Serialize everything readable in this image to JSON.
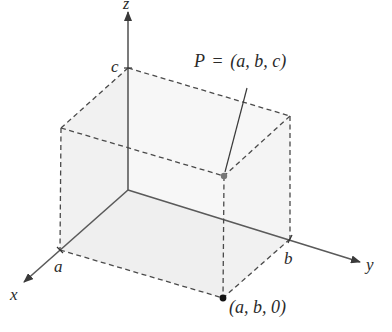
{
  "diagram": {
    "type": "3d-coordinate-box",
    "axes": {
      "x": {
        "label": "x"
      },
      "y": {
        "label": "y"
      },
      "z": {
        "label": "z"
      }
    },
    "ticks": {
      "a": "a",
      "b": "b",
      "c": "c"
    },
    "points": {
      "P": {
        "label_prefix": "P",
        "equals": "=",
        "coords": "(a, b, c)"
      },
      "foot": {
        "coords": "(a, b, 0)"
      }
    },
    "colors": {
      "axis": "#5a5a5a",
      "dashed_edge": "#4a4a4a",
      "face_shading": "#eeeeee",
      "point_P": "#777777",
      "point_foot": "#111111",
      "text": "#2a2a2a"
    }
  }
}
